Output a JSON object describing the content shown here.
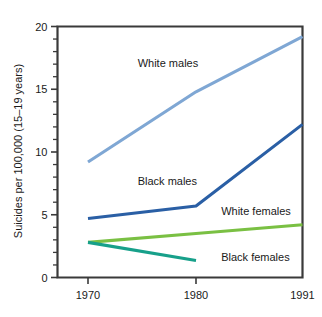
{
  "chart_data": {
    "type": "line",
    "title": "",
    "xlabel": "",
    "ylabel": "Suicides per 100,000 (15–19 years)",
    "x": [
      1970,
      1980,
      1991
    ],
    "xtick_labels": [
      "1970",
      "1980",
      "1991"
    ],
    "ytick_labels": [
      "0",
      "5",
      "10",
      "15",
      "20"
    ],
    "ytick_values": [
      0,
      5,
      10,
      15,
      20
    ],
    "xlim": [
      1970,
      1991
    ],
    "ylim": [
      0,
      20
    ],
    "y_minor_tick_step": 1,
    "grid": false,
    "legend_position": "inline-annotations",
    "series": [
      {
        "name": "White males",
        "label": "White males",
        "color": "#7fa7d4",
        "x": [
          1970,
          1980,
          1991
        ],
        "values": [
          9.2,
          14.8,
          19.2
        ],
        "label_x": 1974.6,
        "label_y": 17.1
      },
      {
        "name": "Black males",
        "label": "Black males",
        "color": "#2a5fa5",
        "x": [
          1970,
          1980,
          1991
        ],
        "values": [
          4.7,
          5.7,
          12.2
        ],
        "label_x": 1974.6,
        "label_y": 7.7
      },
      {
        "name": "White females",
        "label": "White females",
        "color": "#7ac043",
        "x": [
          1970,
          1980,
          1991
        ],
        "values": [
          2.8,
          3.5,
          4.2
        ],
        "label_x": 1982.6,
        "label_y": 5.3
      },
      {
        "name": "Black females",
        "label": "Black females",
        "color": "#17a08a",
        "x": [
          1970,
          1980
        ],
        "values": [
          2.8,
          1.35
        ],
        "label_x": 1982.6,
        "label_y": 1.6
      }
    ]
  }
}
